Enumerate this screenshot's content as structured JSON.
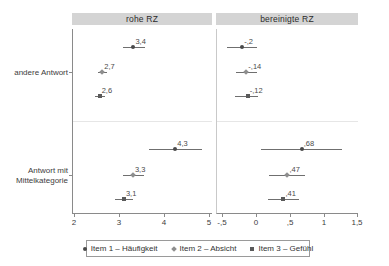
{
  "figure": {
    "panels": [
      {
        "id": "raw",
        "title": "rohe RZ"
      },
      {
        "id": "adjusted",
        "title": "bereinigte RZ"
      }
    ],
    "y_categories": [
      {
        "id": "other",
        "line1": "andere Antwort",
        "line2": ""
      },
      {
        "id": "midcat",
        "line1": "Antwort mit",
        "line2": "Mittelkategorie"
      }
    ],
    "legend": {
      "entries": [
        {
          "label": "Item 1 – Häufigkeit",
          "marker": "circle",
          "color": "#4a4a4a"
        },
        {
          "label": "Item 2 – Absicht",
          "marker": "diamond",
          "color": "#8e8e8e"
        },
        {
          "label": "Item 3 – Gefühl",
          "marker": "square",
          "color": "#5a5a5a"
        }
      ]
    }
  },
  "chart_data": {
    "type": "scatter",
    "title": "",
    "subtitle": "",
    "xlabel": "",
    "ylabel": "",
    "grid": false,
    "legend_position": "bottom",
    "panels": [
      {
        "name": "rohe RZ",
        "xlim": [
          2,
          5
        ],
        "xticks": [
          2,
          3,
          4,
          5
        ],
        "xticklabels": [
          "2",
          "3",
          "4",
          "5"
        ],
        "groups": [
          {
            "category": "andere Antwort",
            "points": [
              {
                "series": "Item 1 – Häufigkeit",
                "value": 3.32,
                "label": "3,4",
                "ci_low": 3.08,
                "ci_high": 3.57
              },
              {
                "series": "Item 2 – Absicht",
                "value": 2.63,
                "label": "2,7",
                "ci_low": 2.53,
                "ci_high": 2.73
              },
              {
                "series": "Item 3 – Gefühl",
                "value": 2.57,
                "label": "2,6",
                "ci_low": 2.46,
                "ci_high": 2.68
              }
            ]
          },
          {
            "category": "Antwort mit Mittelkategorie",
            "points": [
              {
                "series": "Item 1 – Häufigkeit",
                "value": 4.25,
                "label": "4,3",
                "ci_low": 3.67,
                "ci_high": 4.85
              },
              {
                "series": "Item 2 – Absicht",
                "value": 3.31,
                "label": "3,3",
                "ci_low": 3.08,
                "ci_high": 3.55
              },
              {
                "series": "Item 3 – Gefühl",
                "value": 3.11,
                "label": "3,1",
                "ci_low": 2.9,
                "ci_high": 3.32
              }
            ]
          }
        ]
      },
      {
        "name": "bereinigte RZ",
        "xlim": [
          -0.5,
          1.5
        ],
        "xticks": [
          -0.5,
          0,
          0.5,
          1,
          1.5
        ],
        "xticklabels": [
          "-,5",
          "0",
          ",5",
          "1",
          "1,5"
        ],
        "groups": [
          {
            "category": "andere Antwort",
            "points": [
              {
                "series": "Item 1 – Häufigkeit",
                "value": -0.2,
                "label": "-,2",
                "ci_low": -0.42,
                "ci_high": 0.02
              },
              {
                "series": "Item 2 – Absicht",
                "value": -0.14,
                "label": "-,14",
                "ci_low": -0.3,
                "ci_high": 0.02
              },
              {
                "series": "Item 3 – Gefühl",
                "value": -0.12,
                "label": "-,12",
                "ci_low": -0.31,
                "ci_high": 0.04
              }
            ]
          },
          {
            "category": "Antwort mit Mittelkategorie",
            "points": [
              {
                "series": "Item 1 – Häufigkeit",
                "value": 0.68,
                "label": ",68",
                "ci_low": 0.08,
                "ci_high": 1.28
              },
              {
                "series": "Item 2 – Absicht",
                "value": 0.47,
                "label": ",47",
                "ci_low": 0.2,
                "ci_high": 0.73
              },
              {
                "series": "Item 3 – Gefühl",
                "value": 0.41,
                "label": ",41",
                "ci_low": 0.18,
                "ci_high": 0.64
              }
            ]
          }
        ]
      }
    ]
  }
}
